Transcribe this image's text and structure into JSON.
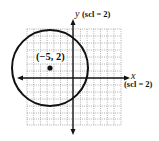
{
  "graph": {
    "y_axis_label": "y",
    "y_axis_scale": "(scl = 2)",
    "x_axis_label": "x",
    "x_axis_scale": "(scl = 2)",
    "center_label": "(−5, 2)",
    "center": {
      "x": -5,
      "y": 2
    },
    "grid": {
      "x_range": [
        -14,
        14
      ],
      "y_range": [
        -14,
        14
      ],
      "scale": 2
    },
    "circle": {
      "center_x": -5,
      "center_y": 2,
      "radius_units": 11
    },
    "colors": {
      "stroke": "#111111",
      "grid": "#9a9a9a",
      "background": "#ffffff"
    }
  }
}
